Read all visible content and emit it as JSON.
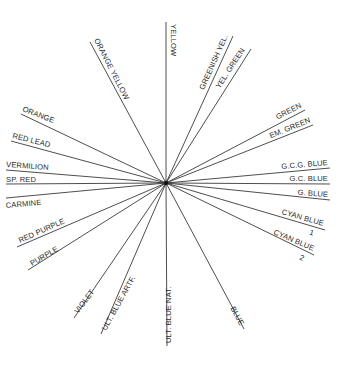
{
  "diagram": {
    "type": "radial-color-circle",
    "center": [
      166,
      183
    ],
    "spokes": [
      {
        "label": "YELLOW",
        "end": [
          166,
          22
        ],
        "tx": 171,
        "ty": 24,
        "rot": 90,
        "anchor": "start"
      },
      {
        "label": "ORANGE YELLOW",
        "end": [
          90,
          42
        ],
        "tx": 94,
        "ty": 40,
        "rot": 63,
        "anchor": "start"
      },
      {
        "label": "GREENISH YEL.",
        "end": [
          233,
          36
        ],
        "tx": 228,
        "ty": 36,
        "rot": -66,
        "anchor": "end"
      },
      {
        "label": "YEL. GREEN",
        "end": [
          251,
          49
        ],
        "tx": 245,
        "ty": 50,
        "rot": -57,
        "anchor": "end"
      },
      {
        "label": "GREEN",
        "end": [
          305,
          110
        ],
        "tx": 302,
        "ty": 107,
        "rot": -27,
        "anchor": "end"
      },
      {
        "label": "EM. GREEN",
        "end": [
          313,
          125
        ],
        "tx": 311,
        "ty": 122,
        "rot": -22,
        "anchor": "end"
      },
      {
        "label": "G.C.G. BLUE",
        "end": [
          330,
          168
        ],
        "tx": 328,
        "ty": 165,
        "rot": -5,
        "anchor": "end"
      },
      {
        "label": "G.C. BLUE",
        "end": [
          330,
          184
        ],
        "tx": 328,
        "ty": 181,
        "rot": 0,
        "anchor": "end"
      },
      {
        "label": "G. BLUE",
        "end": [
          330,
          200
        ],
        "tx": 328,
        "ty": 197,
        "rot": 4,
        "anchor": "end"
      },
      {
        "label": "CYAN BLUE",
        "sub": "1",
        "end": [
          325,
          230
        ],
        "tx": 323,
        "ty": 226,
        "rot": 16,
        "anchor": "end"
      },
      {
        "label": "CYAN BLUE",
        "sub": "2",
        "end": [
          314,
          255
        ],
        "tx": 313,
        "ty": 251,
        "rot": 23,
        "anchor": "end"
      },
      {
        "label": "BLUE",
        "end": [
          244,
          329
        ],
        "tx": 240,
        "ty": 326,
        "rot": 61,
        "anchor": "end"
      },
      {
        "label": "ULT. BLUE NAT.",
        "end": [
          167,
          346
        ],
        "tx": 171,
        "ty": 343,
        "rot": -90,
        "anchor": "start"
      },
      {
        "label": "ULT. BLUE ARTF.",
        "end": [
          101,
          334
        ],
        "tx": 106,
        "ty": 331,
        "rot": -61,
        "anchor": "start"
      },
      {
        "label": "VIOLET",
        "end": [
          74,
          318
        ],
        "tx": 78,
        "ty": 314,
        "rot": -53,
        "anchor": "start"
      },
      {
        "label": "PURPLE",
        "end": [
          28,
          270
        ],
        "tx": 32,
        "ty": 266,
        "rot": -30,
        "anchor": "start"
      },
      {
        "label": "RED PURPLE",
        "end": [
          17,
          247
        ],
        "tx": 20,
        "ty": 243,
        "rot": -24,
        "anchor": "start"
      },
      {
        "label": "CARMINE",
        "end": [
          6,
          198
        ],
        "tx": 6,
        "ty": 208,
        "rot": -5,
        "anchor": "start"
      },
      {
        "label": "SP. RED",
        "end": [
          6,
          184
        ],
        "tx": 6,
        "ty": 182,
        "rot": 0,
        "anchor": "start"
      },
      {
        "label": "VERMILION",
        "end": [
          6,
          170
        ],
        "tx": 6,
        "ty": 167,
        "rot": 4,
        "anchor": "start"
      },
      {
        "label": "RED LEAD",
        "end": [
          11,
          141
        ],
        "tx": 12,
        "ty": 138,
        "rot": 14,
        "anchor": "start"
      },
      {
        "label": "ORANGE",
        "end": [
          21,
          114
        ],
        "tx": 22,
        "ty": 111,
        "rot": 21,
        "anchor": "start"
      }
    ]
  },
  "colors": {
    "line": "#3a3a3a",
    "text": "#2a2a2a",
    "background": "#ffffff"
  }
}
